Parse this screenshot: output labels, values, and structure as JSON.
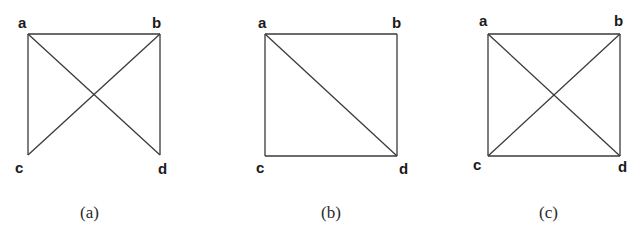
{
  "figure": {
    "panels": [
      {
        "caption": "(a)",
        "vertices": {
          "a": {
            "label": "a",
            "x": 28,
            "y": 34
          },
          "b": {
            "label": "b",
            "x": 160,
            "y": 34
          },
          "c": {
            "label": "c",
            "x": 28,
            "y": 155
          },
          "d": {
            "label": "d",
            "x": 160,
            "y": 155
          }
        },
        "edges": [
          [
            "a",
            "b"
          ],
          [
            "a",
            "c"
          ],
          [
            "a",
            "d"
          ],
          [
            "b",
            "c"
          ],
          [
            "b",
            "d"
          ]
        ]
      },
      {
        "caption": "(b)",
        "vertices": {
          "a": {
            "label": "a",
            "x": 265,
            "y": 34
          },
          "b": {
            "label": "b",
            "x": 397,
            "y": 34
          },
          "c": {
            "label": "c",
            "x": 265,
            "y": 156
          },
          "d": {
            "label": "d",
            "x": 397,
            "y": 156
          }
        },
        "edges": [
          [
            "a",
            "b"
          ],
          [
            "a",
            "c"
          ],
          [
            "a",
            "d"
          ],
          [
            "b",
            "d"
          ],
          [
            "c",
            "d"
          ]
        ]
      },
      {
        "caption": "(c)",
        "vertices": {
          "a": {
            "label": "a",
            "x": 488,
            "y": 34
          },
          "b": {
            "label": "b",
            "x": 620,
            "y": 34
          },
          "c": {
            "label": "c",
            "x": 488,
            "y": 156
          },
          "d": {
            "label": "d",
            "x": 620,
            "y": 156
          }
        },
        "edges": [
          [
            "a",
            "b"
          ],
          [
            "a",
            "c"
          ],
          [
            "a",
            "d"
          ],
          [
            "b",
            "c"
          ],
          [
            "b",
            "d"
          ],
          [
            "c",
            "d"
          ]
        ]
      }
    ]
  }
}
